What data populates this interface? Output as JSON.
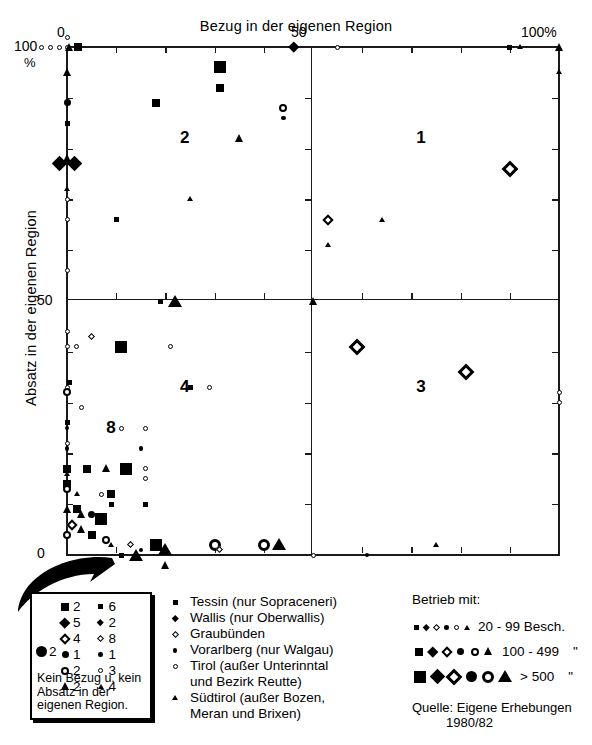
{
  "chart_data": {
    "type": "scatter",
    "title": "Bezug in der eigenen Region",
    "xlabel": "Bezug in der eigenen Region",
    "ylabel": "Absatz in der eigenen Region",
    "xlim": [
      0,
      100
    ],
    "ylim": [
      0,
      100
    ],
    "x_unit": "%",
    "y_unit": "%",
    "xticks": [
      0,
      50,
      100
    ],
    "xticklabels": [
      "0",
      "50",
      "100%"
    ],
    "yticks": [
      0,
      50,
      100
    ],
    "yticklabels": [
      "0",
      "50",
      "100"
    ],
    "minor_tick_step": 10,
    "grid": false,
    "quadrant_labels": [
      {
        "id": "1",
        "x": 72,
        "y": 82
      },
      {
        "id": "2",
        "x": 24,
        "y": 82
      },
      {
        "id": "3",
        "x": 72,
        "y": 33
      },
      {
        "id": "4",
        "x": 24,
        "y": 33
      },
      {
        "id": "8",
        "x": 9,
        "y": 25
      }
    ],
    "series": [
      {
        "name": "Tessin (nur Sopraceneri)",
        "marker": "square"
      },
      {
        "name": "Wallis (nur Oberwallis)",
        "marker": "diamond-filled"
      },
      {
        "name": "Graubünden",
        "marker": "diamond-open"
      },
      {
        "name": "Vorarlberg (nur Walgau)",
        "marker": "circle-filled"
      },
      {
        "name": "Tirol (außer Unterinntal und Bezirk Reutte)",
        "marker": "circle-open"
      },
      {
        "name": "Südtirol (außer Bozen, Meran und Brixen)",
        "marker": "triangle"
      }
    ],
    "size_classes": [
      {
        "label": "20 -  99 Besch.",
        "size": "small"
      },
      {
        "label": "100 - 499",
        "size": "medium",
        "unit": "\""
      },
      {
        "label": "> 500",
        "size": "large",
        "unit": "\""
      }
    ],
    "points": [
      {
        "x": 0,
        "y": 100,
        "m": "circle-open",
        "s": "s"
      },
      {
        "x": -1.6,
        "y": 100,
        "m": "circle-open",
        "s": "s"
      },
      {
        "x": -3.4,
        "y": 100,
        "m": "circle-open",
        "s": "s"
      },
      {
        "x": -5.2,
        "y": 100,
        "m": "circle-open",
        "s": "s"
      },
      {
        "x": 0,
        "y": 101.8,
        "m": "circle-open",
        "s": "s"
      },
      {
        "x": 0.6,
        "y": 100,
        "m": "triangle",
        "s": "m"
      },
      {
        "x": 2.2,
        "y": 100,
        "m": "square",
        "s": "m"
      },
      {
        "x": 46,
        "y": 100,
        "m": "diamond-filled",
        "s": "m"
      },
      {
        "x": 55,
        "y": 100,
        "m": "circle-open",
        "s": "s"
      },
      {
        "x": 90,
        "y": 100,
        "m": "square",
        "s": "s"
      },
      {
        "x": 92,
        "y": 100,
        "m": "triangle",
        "s": "s"
      },
      {
        "x": 100,
        "y": 100,
        "m": "triangle",
        "s": "m"
      },
      {
        "x": 0,
        "y": 95,
        "m": "triangle",
        "s": "m"
      },
      {
        "x": 100,
        "y": 95,
        "m": "triangle",
        "s": "s"
      },
      {
        "x": 31,
        "y": 96,
        "m": "square",
        "s": "l"
      },
      {
        "x": 31,
        "y": 92,
        "m": "square",
        "s": "m"
      },
      {
        "x": 0,
        "y": 89,
        "m": "circle-filled",
        "s": "m"
      },
      {
        "x": 18,
        "y": 89,
        "m": "square",
        "s": "m"
      },
      {
        "x": 44,
        "y": 88,
        "m": "circle-open",
        "s": "m"
      },
      {
        "x": 44,
        "y": 86,
        "m": "circle-filled",
        "s": "s"
      },
      {
        "x": 0,
        "y": 85,
        "m": "square",
        "s": "s"
      },
      {
        "x": 35,
        "y": 82,
        "m": "triangle",
        "s": "m"
      },
      {
        "x": 0,
        "y": 78,
        "m": "triangle",
        "s": "m"
      },
      {
        "x": -1.5,
        "y": 77,
        "m": "diamond-filled",
        "s": "l"
      },
      {
        "x": 1.5,
        "y": 77,
        "m": "diamond-filled",
        "s": "l"
      },
      {
        "x": 90,
        "y": 76,
        "m": "diamond-open",
        "s": "l"
      },
      {
        "x": 0,
        "y": 72,
        "m": "triangle",
        "s": "s"
      },
      {
        "x": 0,
        "y": 70,
        "m": "circle-open",
        "s": "s"
      },
      {
        "x": 25,
        "y": 70,
        "m": "triangle",
        "s": "s"
      },
      {
        "x": 0,
        "y": 66,
        "m": "circle-open",
        "s": "s"
      },
      {
        "x": 10,
        "y": 66,
        "m": "square",
        "s": "s"
      },
      {
        "x": 53,
        "y": 66,
        "m": "diamond-open",
        "s": "m"
      },
      {
        "x": 64,
        "y": 66,
        "m": "triangle",
        "s": "s"
      },
      {
        "x": 53,
        "y": 61,
        "m": "triangle",
        "s": "s"
      },
      {
        "x": 0,
        "y": 56,
        "m": "circle-open",
        "s": "s"
      },
      {
        "x": 50,
        "y": 50,
        "m": "triangle",
        "s": "m"
      },
      {
        "x": 19,
        "y": 50,
        "m": "square",
        "s": "s"
      },
      {
        "x": 22,
        "y": 50,
        "m": "triangle",
        "s": "l"
      },
      {
        "x": 0,
        "y": 44,
        "m": "circle-open",
        "s": "s"
      },
      {
        "x": 5,
        "y": 43,
        "m": "diamond-open",
        "s": "s"
      },
      {
        "x": 0,
        "y": 41,
        "m": "circle-open",
        "s": "s"
      },
      {
        "x": 2,
        "y": 41,
        "m": "circle-open",
        "s": "s"
      },
      {
        "x": 11,
        "y": 41,
        "m": "square",
        "s": "l"
      },
      {
        "x": 21,
        "y": 41,
        "m": "circle-open",
        "s": "s"
      },
      {
        "x": 59,
        "y": 41,
        "m": "diamond-open",
        "s": "l"
      },
      {
        "x": 81,
        "y": 36,
        "m": "diamond-open",
        "s": "l"
      },
      {
        "x": 0,
        "y": 33,
        "m": "circle-open",
        "s": "s"
      },
      {
        "x": 0,
        "y": 32,
        "m": "circle-open",
        "s": "m"
      },
      {
        "x": 0.5,
        "y": 34,
        "m": "square",
        "s": "s"
      },
      {
        "x": 25,
        "y": 33,
        "m": "square",
        "s": "s"
      },
      {
        "x": 29,
        "y": 33,
        "m": "circle-open",
        "s": "s"
      },
      {
        "x": 100,
        "y": 32,
        "m": "circle-open",
        "s": "s"
      },
      {
        "x": 100,
        "y": 30,
        "m": "circle-open",
        "s": "s"
      },
      {
        "x": 3,
        "y": 29,
        "m": "circle-open",
        "s": "s"
      },
      {
        "x": 0,
        "y": 26,
        "m": "square",
        "s": "s"
      },
      {
        "x": 0,
        "y": 25,
        "m": "circle-filled",
        "s": "s"
      },
      {
        "x": 11,
        "y": 25,
        "m": "circle-open",
        "s": "s"
      },
      {
        "x": 16,
        "y": 25,
        "m": "circle-open",
        "s": "s"
      },
      {
        "x": 0,
        "y": 22,
        "m": "circle-open",
        "s": "s"
      },
      {
        "x": 0,
        "y": 21,
        "m": "circle-filled",
        "s": "s"
      },
      {
        "x": 15,
        "y": 21,
        "m": "circle-filled",
        "s": "s"
      },
      {
        "x": 0,
        "y": 17,
        "m": "square",
        "s": "m"
      },
      {
        "x": 0,
        "y": 16,
        "m": "triangle",
        "s": "s"
      },
      {
        "x": 4,
        "y": 17,
        "m": "square",
        "s": "m"
      },
      {
        "x": 8,
        "y": 17,
        "m": "triangle",
        "s": "m"
      },
      {
        "x": 12,
        "y": 17,
        "m": "square",
        "s": "l"
      },
      {
        "x": 16,
        "y": 17,
        "m": "circle-open",
        "s": "s"
      },
      {
        "x": 16,
        "y": 15,
        "m": "circle-open",
        "s": "s"
      },
      {
        "x": 0,
        "y": 14,
        "m": "square",
        "s": "m"
      },
      {
        "x": 0,
        "y": 13,
        "m": "circle-open",
        "s": "m"
      },
      {
        "x": 2,
        "y": 12,
        "m": "triangle",
        "s": "s"
      },
      {
        "x": 7,
        "y": 12,
        "m": "circle-open",
        "s": "s"
      },
      {
        "x": 9,
        "y": 12,
        "m": "square",
        "s": "m"
      },
      {
        "x": 9,
        "y": 10,
        "m": "square",
        "s": "s"
      },
      {
        "x": 16,
        "y": 10,
        "m": "square",
        "s": "s"
      },
      {
        "x": 0,
        "y": 9,
        "m": "triangle",
        "s": "m"
      },
      {
        "x": 2,
        "y": 9,
        "m": "square",
        "s": "m"
      },
      {
        "x": 3,
        "y": 8,
        "m": "triangle",
        "s": "m"
      },
      {
        "x": 5,
        "y": 8,
        "m": "circle-filled",
        "s": "m"
      },
      {
        "x": 7,
        "y": 7,
        "m": "square",
        "s": "l"
      },
      {
        "x": 1,
        "y": 6,
        "m": "diamond-open",
        "s": "m"
      },
      {
        "x": 3,
        "y": 5,
        "m": "triangle",
        "s": "m"
      },
      {
        "x": 5,
        "y": 4,
        "m": "square",
        "s": "m"
      },
      {
        "x": 0,
        "y": 4,
        "m": "circle-open",
        "s": "m"
      },
      {
        "x": 8,
        "y": 3,
        "m": "circle-open",
        "s": "m"
      },
      {
        "x": 9,
        "y": 2,
        "m": "triangle",
        "s": "s"
      },
      {
        "x": 13,
        "y": 2,
        "m": "diamond-open",
        "s": "s"
      },
      {
        "x": 15,
        "y": 1,
        "m": "circle-filled",
        "s": "s"
      },
      {
        "x": 18,
        "y": 2,
        "m": "square",
        "s": "l"
      },
      {
        "x": 20,
        "y": 1,
        "m": "triangle",
        "s": "l"
      },
      {
        "x": 30,
        "y": 2,
        "m": "circle-open",
        "s": "l"
      },
      {
        "x": 31,
        "y": 1,
        "m": "diamond-open",
        "s": "s"
      },
      {
        "x": 40,
        "y": 2,
        "m": "circle-open",
        "s": "l"
      },
      {
        "x": 43,
        "y": 2,
        "m": "triangle",
        "s": "l"
      },
      {
        "x": 50,
        "y": 0,
        "m": "circle-open",
        "s": "s"
      },
      {
        "x": 61,
        "y": 0,
        "m": "circle-filled",
        "s": "s"
      },
      {
        "x": 75,
        "y": 2,
        "m": "triangle",
        "s": "s"
      },
      {
        "x": 11,
        "y": 0,
        "m": "square",
        "s": "s"
      },
      {
        "x": 14,
        "y": 0,
        "m": "triangle",
        "s": "l"
      },
      {
        "x": 20,
        "y": -2,
        "m": "triangle",
        "s": "m"
      },
      {
        "x": 6,
        "y": -1,
        "m": "circle-open",
        "s": "s"
      }
    ]
  },
  "axes": {
    "x_label_top": "Bezug in der eigenen Region",
    "y_label_left": "Absatz in der eigenen Region",
    "x0": "0",
    "x50": "50",
    "x100": "100%",
    "y100": "100",
    "y_percent": "%",
    "y50": "50",
    "y0": "0",
    "x0_bottom": "0"
  },
  "callout": {
    "columns": [
      {
        "size": "medium",
        "items": [
          {
            "marker": "square",
            "count": "2"
          },
          {
            "marker": "diamond-filled",
            "count": "5"
          },
          {
            "marker": "diamond-open",
            "count": "4"
          },
          {
            "marker": "circle-filled",
            "count": "1"
          },
          {
            "marker": "circle-open",
            "count": "2"
          },
          {
            "marker": "triangle",
            "count": "2"
          }
        ]
      },
      {
        "size": "small",
        "items": [
          {
            "marker": "square",
            "count": "6"
          },
          {
            "marker": "diamond-filled",
            "count": "2"
          },
          {
            "marker": "diamond-open",
            "count": "8"
          },
          {
            "marker": "circle-filled",
            "count": "1"
          },
          {
            "marker": "circle-open",
            "count": "3"
          },
          {
            "marker": "triangle",
            "count": "4"
          }
        ]
      }
    ],
    "big": {
      "marker": "circle-filled",
      "size": "large",
      "count": "2"
    },
    "text": "Kein Bezug u. kein Absatz in der eigenen Region."
  },
  "legend_regions": {
    "items": [
      {
        "marker": "square",
        "label": "Tessin (nur Sopraceneri)",
        "sub": ""
      },
      {
        "marker": "diamond-filled",
        "label": "Wallis (nur Oberwallis)",
        "sub": ""
      },
      {
        "marker": "diamond-open",
        "label": "Graubünden",
        "sub": ""
      },
      {
        "marker": "circle-filled",
        "label": "Vorarlberg (nur Walgau)",
        "sub": ""
      },
      {
        "marker": "circle-open",
        "label": "Tirol (außer Unterinntal",
        "sub": "und Bezirk Reutte)"
      },
      {
        "marker": "triangle",
        "label": "Südtirol (außer Bozen,",
        "sub": "Meran und Brixen)"
      }
    ]
  },
  "legend_size": {
    "title": "Betrieb mit:",
    "rows": [
      {
        "size": "s",
        "label": "20 -  99 Besch.",
        "quote": ""
      },
      {
        "size": "m",
        "label": "100 - 499",
        "quote": "\""
      },
      {
        "size": "l",
        "label": "> 500",
        "quote": "\""
      }
    ]
  },
  "source": {
    "line1": "Quelle: Eigene Erhebungen",
    "line2": "1980/82"
  }
}
